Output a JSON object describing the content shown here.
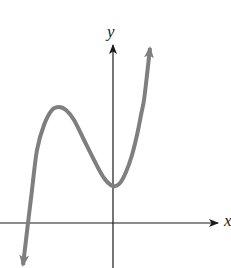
{
  "chart_data": {
    "type": "line",
    "title": "",
    "xlabel": "x",
    "ylabel": "y",
    "grid": false,
    "legend": null,
    "axis_origin_px": [
      113,
      223
    ],
    "points_px": [
      [
        23,
        265
      ],
      [
        26,
        240
      ],
      [
        28,
        223
      ],
      [
        32,
        190
      ],
      [
        37,
        150
      ],
      [
        44,
        125
      ],
      [
        52,
        110
      ],
      [
        59,
        107
      ],
      [
        66,
        110
      ],
      [
        74,
        120
      ],
      [
        84,
        140
      ],
      [
        94,
        160
      ],
      [
        104,
        178
      ],
      [
        113,
        186
      ],
      [
        120,
        183
      ],
      [
        126,
        172
      ],
      [
        132,
        155
      ],
      [
        137,
        135
      ],
      [
        141,
        115
      ],
      [
        144,
        100
      ],
      [
        147,
        75
      ],
      [
        150,
        48
      ]
    ],
    "features": {
      "local_max_px": [
        59,
        107
      ],
      "local_min_px": [
        113,
        186
      ],
      "x_intercept_px": [
        28,
        223
      ]
    },
    "colors": {
      "curve": "#7f7f7f",
      "axes": "#1a1a1a"
    }
  },
  "labels": {
    "x_axis": "x",
    "y_axis": "y"
  }
}
